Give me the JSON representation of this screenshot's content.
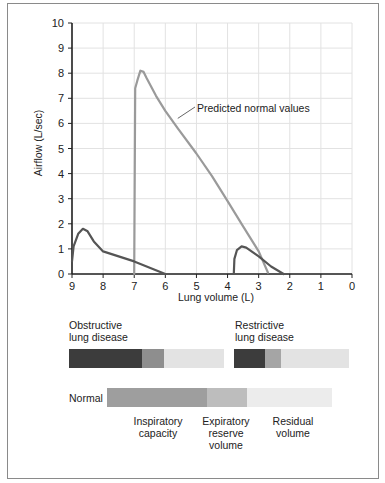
{
  "chart_data": {
    "type": "line",
    "title": "",
    "xlabel": "Lung volume (L)",
    "ylabel": "Airflow (L/sec)",
    "xlim": [
      9,
      0
    ],
    "ylim": [
      0,
      10
    ],
    "x_ticks": [
      "9",
      "8",
      "7",
      "6",
      "5",
      "4",
      "3",
      "2",
      "1",
      "0"
    ],
    "y_ticks": [
      "0",
      "1",
      "2",
      "3",
      "4",
      "5",
      "6",
      "7",
      "8",
      "9",
      "10"
    ],
    "grid": true,
    "annotations": [
      {
        "text": "Predicted normal values",
        "points_to_x": 5.6,
        "points_to_y": 6.2
      }
    ],
    "series": [
      {
        "name": "Predicted normal values",
        "color": "#9a9a9a",
        "x": [
          7.0,
          6.97,
          6.9,
          6.8,
          6.7,
          6.6,
          6.3,
          6.0,
          5.6,
          5.0,
          4.5,
          4.0,
          3.5,
          3.0,
          2.7
        ],
        "y": [
          0,
          7.4,
          7.7,
          8.1,
          8.05,
          7.8,
          7.1,
          6.5,
          5.8,
          4.8,
          3.9,
          2.9,
          1.9,
          0.9,
          0.05
        ]
      },
      {
        "name": "Obstructive lung disease",
        "color": "#555555",
        "x": [
          9.0,
          8.95,
          8.8,
          8.65,
          8.5,
          8.3,
          8.0,
          7.0,
          6.0
        ],
        "y": [
          0.5,
          1.1,
          1.6,
          1.8,
          1.7,
          1.3,
          0.9,
          0.5,
          0
        ]
      },
      {
        "name": "Restrictive lung disease",
        "color": "#555555",
        "x": [
          3.8,
          3.78,
          3.7,
          3.55,
          3.4,
          3.0,
          2.6,
          2.2
        ],
        "y": [
          0,
          0.6,
          0.95,
          1.1,
          1.05,
          0.7,
          0.3,
          0
        ]
      }
    ]
  },
  "axes": {
    "xlabel": "Lung volume (L)",
    "ylabel": "Airflow (L/sec)",
    "x_ticks": [
      "9",
      "8",
      "7",
      "6",
      "5",
      "4",
      "3",
      "2",
      "1",
      "0"
    ],
    "y_ticks": [
      "0",
      "1",
      "2",
      "3",
      "4",
      "5",
      "6",
      "7",
      "8",
      "9",
      "10"
    ],
    "annotation": "Predicted normal values"
  },
  "bars": {
    "obstructive": {
      "label_line1": "Obstructive",
      "label_line2": "lung disease",
      "segments": [
        {
          "name": "Inspiratory capacity",
          "width": 73,
          "color": "#3c3c3c"
        },
        {
          "name": "Expiratory reserve volume",
          "width": 22,
          "color": "#8e8e8e"
        },
        {
          "name": "Residual volume",
          "width": 60,
          "color": "#e3e3e3"
        }
      ]
    },
    "restrictive": {
      "label_line1": "Restrictive",
      "label_line2": "lung disease",
      "segments": [
        {
          "name": "Inspiratory capacity",
          "width": 31,
          "color": "#3c3c3c"
        },
        {
          "name": "Expiratory reserve volume",
          "width": 16,
          "color": "#a5a5a5"
        },
        {
          "name": "Residual volume",
          "width": 68,
          "color": "#e3e3e3"
        }
      ]
    },
    "normal": {
      "label": "Normal",
      "segments": [
        {
          "name": "Inspiratory capacity",
          "width": 100,
          "color": "#9e9e9e"
        },
        {
          "name": "Expiratory reserve volume",
          "width": 40,
          "color": "#bdbdbd"
        },
        {
          "name": "Residual volume",
          "width": 85,
          "color": "#ececec"
        }
      ]
    },
    "legend": {
      "inspiratory_1": "Inspiratory",
      "inspiratory_2": "capacity",
      "expiratory_1": "Expiratory",
      "expiratory_2": "reserve",
      "expiratory_3": "volume",
      "residual_1": "Residual",
      "residual_2": "volume"
    }
  }
}
